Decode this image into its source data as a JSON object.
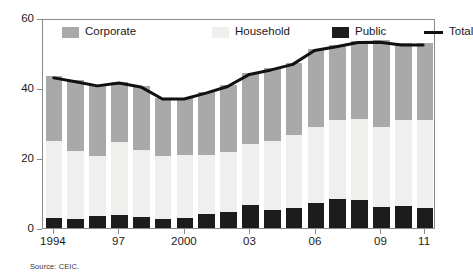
{
  "chart_data": {
    "type": "bar",
    "subtype": "stacked-bar-with-line-overlay",
    "title": "",
    "subtitle": "",
    "xlabel": "",
    "ylabel": "",
    "ylim": [
      0,
      60
    ],
    "yticks": [
      0,
      20,
      40,
      60
    ],
    "ytick_labels": [
      "0",
      "20",
      "40",
      "60"
    ],
    "grid": false,
    "legend_position": "top-inside",
    "categories": [
      "1994",
      "1995",
      "1996",
      "1997",
      "1998",
      "1999",
      "2000",
      "2001",
      "2002",
      "2003",
      "2004",
      "2005",
      "2006",
      "2007",
      "2008",
      "2009",
      "2010",
      "2011"
    ],
    "xtick_labels_shown": [
      "1994",
      "97",
      "2000",
      "03",
      "06",
      "09",
      "11"
    ],
    "xtick_label_indices": [
      0,
      3,
      6,
      9,
      12,
      15,
      17
    ],
    "series": [
      {
        "name": "Public",
        "color": "#1c1c1c",
        "stack_order": 1,
        "values": [
          3.0,
          2.5,
          3.3,
          3.6,
          3.1,
          2.5,
          3.0,
          3.9,
          4.7,
          6.6,
          5.2,
          5.7,
          7.2,
          8.4,
          7.9,
          6.0,
          6.4,
          5.8
        ]
      },
      {
        "name": "Household",
        "color": "#efefee",
        "stack_order": 2,
        "values": [
          21.9,
          19.6,
          17.2,
          21.0,
          19.3,
          18.0,
          17.8,
          16.9,
          17.1,
          17.4,
          19.8,
          21.0,
          21.7,
          22.6,
          23.3,
          22.8,
          24.4,
          25.1
        ]
      },
      {
        "name": "Corporate",
        "color": "#a9a9a9",
        "stack_order": 3,
        "values": [
          18.4,
          20.1,
          20.5,
          17.2,
          18.3,
          16.7,
          16.4,
          18.1,
          19.0,
          20.3,
          20.6,
          20.5,
          22.3,
          21.3,
          22.3,
          24.8,
          22.0,
          21.9
        ]
      }
    ],
    "overlay_line": {
      "name": "Total",
      "color": "#111111",
      "values": [
        43.3,
        42.2,
        41.0,
        41.8,
        40.7,
        37.2,
        37.2,
        38.9,
        40.8,
        44.3,
        45.6,
        47.2,
        51.2,
        52.3,
        53.5,
        53.6,
        52.8,
        52.8
      ]
    }
  },
  "legend": {
    "items": [
      {
        "label": "Corporate",
        "marker": "swatch-corporate"
      },
      {
        "label": "Household",
        "marker": "swatch-household"
      },
      {
        "label": "Public",
        "marker": "swatch-public"
      },
      {
        "label": "Total",
        "marker": "line-total"
      }
    ]
  },
  "axes": {
    "y_ticks": [
      "0",
      "20",
      "40",
      "60"
    ],
    "x_ticks": [
      "1994",
      "97",
      "2000",
      "03",
      "06",
      "09",
      "11"
    ]
  },
  "footer": {
    "source": "Source: CEIC."
  }
}
